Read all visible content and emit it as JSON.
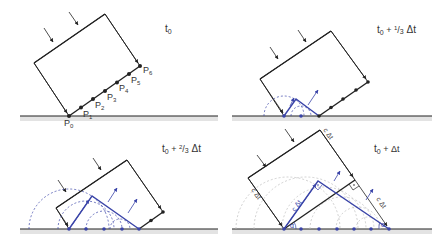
{
  "figure": {
    "panels": [
      {
        "id": "t0",
        "time_label": {
          "base": "t",
          "sub": "0",
          "suffix": ""
        },
        "points": [
          "P0",
          "P1",
          "P2",
          "P3",
          "P4",
          "P5",
          "P6"
        ]
      },
      {
        "id": "t0_plus_one_third",
        "time_label": {
          "base": "t",
          "sub": "0",
          "suffix": " + ¹/₃ Δt"
        }
      },
      {
        "id": "t0_plus_two_thirds",
        "time_label": {
          "base": "t",
          "sub": "0",
          "suffix": " + ²/₃ Δt"
        }
      },
      {
        "id": "t0_plus_dt",
        "time_label": {
          "base": "t",
          "sub": "0",
          "suffix": " + Δt"
        },
        "annotations": {
          "c_dt": "c Δt",
          "alpha": "α"
        }
      }
    ],
    "colors": {
      "wavefront": "#222222",
      "huygens": "#3a44a8",
      "ground": "#222222",
      "ground_shade": "#e3e3e3",
      "arcs_gray": "#bdbdbd"
    }
  }
}
